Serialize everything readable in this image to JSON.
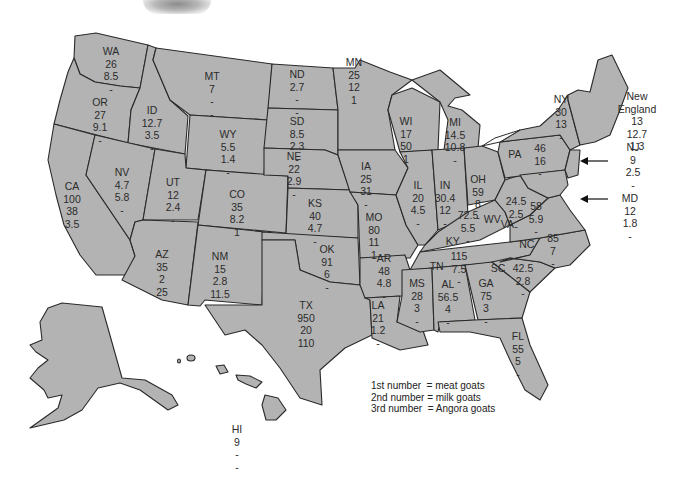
{
  "legend": {
    "lines": [
      "1st number  = meat goats",
      "2nd number = milk goats",
      "3rd number  = Angora goats"
    ]
  },
  "states": [
    {
      "abbr": "WA",
      "values": [
        "26",
        "8.5",
        "-"
      ]
    },
    {
      "abbr": "OR",
      "values": [
        "27",
        "9.1",
        "-"
      ]
    },
    {
      "abbr": "CA",
      "values": [
        "100",
        "38",
        "3.5"
      ]
    },
    {
      "abbr": "ID",
      "values": [
        "12.7",
        "3.5",
        "-"
      ]
    },
    {
      "abbr": "NV",
      "values": [
        "4.7",
        "5.8",
        "-"
      ]
    },
    {
      "abbr": "MT",
      "values": [
        "7",
        "-",
        "-"
      ]
    },
    {
      "abbr": "WY",
      "values": [
        "5.5",
        "1.4",
        "-"
      ]
    },
    {
      "abbr": "UT",
      "values": [
        "12",
        "2.4",
        "-"
      ]
    },
    {
      "abbr": "CO",
      "values": [
        "35",
        "8.2",
        "1"
      ]
    },
    {
      "abbr": "AZ",
      "values": [
        "35",
        "2",
        "25"
      ]
    },
    {
      "abbr": "NM",
      "values": [
        "15",
        "2.8",
        "11.5"
      ]
    },
    {
      "abbr": "ND",
      "values": [
        "2.7",
        "-",
        "-"
      ]
    },
    {
      "abbr": "SD",
      "values": [
        "8.5",
        "2.3",
        "-"
      ]
    },
    {
      "abbr": "NE",
      "values": [
        "22",
        "2.9",
        "-"
      ]
    },
    {
      "abbr": "KS",
      "values": [
        "40",
        "4.7",
        "-"
      ]
    },
    {
      "abbr": "OK",
      "values": [
        "91",
        "6",
        "-"
      ]
    },
    {
      "abbr": "TX",
      "values": [
        "950",
        "20",
        "110"
      ]
    },
    {
      "abbr": "MN",
      "values": [
        "25",
        "12",
        "1"
      ]
    },
    {
      "abbr": "IA",
      "values": [
        "25",
        "31",
        "-"
      ]
    },
    {
      "abbr": "MO",
      "values": [
        "80",
        "11",
        "1"
      ]
    },
    {
      "abbr": "AR",
      "values": [
        "48",
        "4.8",
        "-"
      ]
    },
    {
      "abbr": "LA",
      "values": [
        "21",
        "1.2",
        "-"
      ]
    },
    {
      "abbr": "WI",
      "values": [
        "17",
        "50",
        "1"
      ]
    },
    {
      "abbr": "IL",
      "values": [
        "20",
        "4.5",
        "-"
      ]
    },
    {
      "abbr": "MI",
      "values": [
        "14.5",
        "10.8",
        "-"
      ]
    },
    {
      "abbr": "IN",
      "values": [
        "30.4",
        "12",
        "-"
      ]
    },
    {
      "abbr": "OH",
      "values": [
        "59",
        "8",
        "-"
      ]
    },
    {
      "abbr": "KY",
      "values": [
        "72.5",
        "5.5",
        "-"
      ]
    },
    {
      "abbr": "TN",
      "values": [
        "115",
        "7.5",
        "-"
      ]
    },
    {
      "abbr": "MS",
      "values": [
        "28",
        "3",
        "-"
      ]
    },
    {
      "abbr": "AL",
      "values": [
        "56.5",
        "4",
        "-"
      ]
    },
    {
      "abbr": "GA",
      "values": [
        "75",
        "3",
        "-"
      ]
    },
    {
      "abbr": "FL",
      "values": [
        "55",
        "5",
        "-"
      ]
    },
    {
      "abbr": "SC",
      "values": [
        "42.5",
        "2.8",
        "-"
      ]
    },
    {
      "abbr": "NC",
      "values": [
        "85",
        "7",
        "-"
      ]
    },
    {
      "abbr": "VA",
      "values": [
        "58",
        "5.9",
        "-"
      ]
    },
    {
      "abbr": "WV",
      "values": [
        "24.5",
        "2.5",
        "-"
      ]
    },
    {
      "abbr": "PA",
      "values": [
        "46",
        "16",
        "-"
      ]
    },
    {
      "abbr": "NY",
      "values": [
        "30",
        "13",
        "-"
      ]
    },
    {
      "abbr": "NJ",
      "values": [
        "9",
        "2.5",
        "-"
      ]
    },
    {
      "abbr": "MD",
      "values": [
        "12",
        "1.8",
        "-"
      ]
    },
    {
      "abbr": "New England",
      "values": [
        "13",
        "12.7",
        "1.3"
      ]
    },
    {
      "abbr": "HI",
      "values": [
        "9",
        "-",
        "-"
      ]
    }
  ],
  "colors": {
    "land": "#b3b3b3",
    "border": "#2a2a2a",
    "text": "#2b2b2b"
  }
}
